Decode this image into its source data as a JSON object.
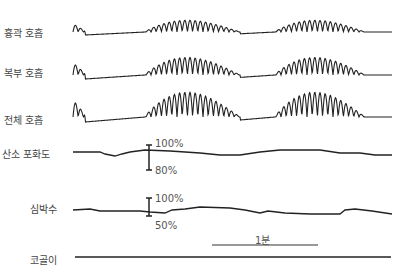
{
  "channels": [
    {
      "id": "thoracic",
      "label": "흉곽 호흡",
      "x": 4,
      "y": 25
    },
    {
      "id": "abdominal",
      "label": "복부 호흡",
      "x": 4,
      "y": 65
    },
    {
      "id": "total",
      "label": "전체 호흡",
      "x": 4,
      "y": 112
    },
    {
      "id": "spo2",
      "label": "산소 포화도",
      "x": 2,
      "y": 146
    },
    {
      "id": "heart_rate",
      "label": "심박수",
      "x": 30,
      "y": 201
    },
    {
      "id": "snore",
      "label": "코골이",
      "x": 30,
      "y": 252
    }
  ],
  "spo2_scale": {
    "top": "100%",
    "bottom": "80%"
  },
  "hr_scale": {
    "top": "100%",
    "bottom": "50%"
  },
  "time_scale": {
    "label": "1분"
  },
  "colors": {
    "trace": "#222222",
    "text": "#444444",
    "background": "#ffffff"
  }
}
